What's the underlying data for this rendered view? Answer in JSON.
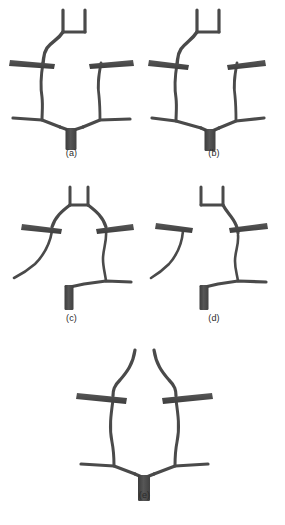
{
  "figure": {
    "type": "scientific-figure",
    "background_color": "#ffffff",
    "vessel_color": "#4a4a4a",
    "vessel_color_light": "#636363",
    "vessel_color_dark": "#3a3a3a",
    "panel_count": 5,
    "panels": [
      {
        "id": "a",
        "label": "(a)",
        "description": "Full bifurcating vessel tree with U-shaped distal prongs, two lateral bars and a thick common trunk"
      },
      {
        "id": "b",
        "label": "(b)",
        "description": "Full bifurcating vessel tree, variant with shorter right lateral branch"
      },
      {
        "id": "c",
        "label": "(c)",
        "description": "Symmetric upper prongs with lateral bars, long free curving branch at left and stepped trunk at lower right"
      },
      {
        "id": "d",
        "label": "(d)",
        "description": "Isolated curving branch with lateral bar at left, and a right-side tree with U-shaped prongs and stepped trunk"
      },
      {
        "id": "e",
        "label": "(e)",
        "description": "Symmetric bifurcation with two long ascending vessels, two lateral bars and a central trunk"
      }
    ]
  }
}
